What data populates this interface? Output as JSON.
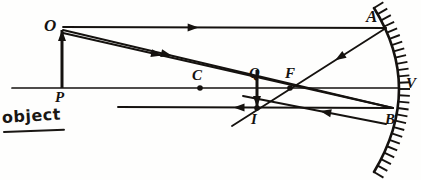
{
  "figure": {
    "kind": "optics-ray-diagram",
    "width": 421,
    "height": 180,
    "ink_color": "#15120f",
    "background_color": "#fefefd"
  },
  "annotation": {
    "object_caption": "object"
  },
  "points": [
    {
      "key": "O",
      "label": "O",
      "x": 62,
      "y": 28,
      "label_x": 44,
      "label_y": 17,
      "size": "big",
      "role": "object-tip",
      "dot": false
    },
    {
      "key": "P",
      "label": "P",
      "x": 62,
      "y": 88,
      "label_x": 55,
      "label_y": 90,
      "size": "mid",
      "role": "object-base-on-axis",
      "dot": false
    },
    {
      "key": "C",
      "label": "C",
      "x": 200,
      "y": 88,
      "label_x": 192,
      "label_y": 68,
      "size": "mid",
      "role": "center-of-curvature",
      "dot": true
    },
    {
      "key": "Q",
      "label": "Q",
      "x": 257,
      "y": 88,
      "label_x": 249,
      "label_y": 66,
      "size": "mid",
      "role": "image-base-on-axis",
      "dot": false
    },
    {
      "key": "F",
      "label": "F",
      "x": 290,
      "y": 88,
      "label_x": 285,
      "label_y": 66,
      "size": "mid",
      "role": "focal-point",
      "dot": true
    },
    {
      "key": "I",
      "label": "I",
      "x": 257,
      "y": 108,
      "label_x": 251,
      "label_y": 112,
      "size": "mid",
      "role": "image-tip",
      "dot": true
    },
    {
      "key": "A",
      "label": "A",
      "x": 386,
      "y": 28,
      "label_x": 366,
      "label_y": 8,
      "size": "big",
      "role": "upper-mirror-strike",
      "dot": false
    },
    {
      "key": "B",
      "label": "B",
      "x": 393,
      "y": 108,
      "label_x": 385,
      "label_y": 112,
      "size": "mid",
      "role": "lower-mirror-strike",
      "dot": false
    },
    {
      "key": "V",
      "label": "V",
      "x": 398,
      "y": 88,
      "label_x": 406,
      "label_y": 76,
      "size": "mid",
      "role": "mirror-vertex",
      "dot": false
    }
  ],
  "mirror": {
    "name": "concave-mirror",
    "vertex_x": 398,
    "vertex_y": 88,
    "top_x": 374,
    "top_y": 8,
    "bottom_x": 374,
    "bottom_y": 172,
    "bulge": 26,
    "hatch_count": 26,
    "hatch_length": 11,
    "stroke_width": 2.6
  },
  "axis": {
    "name": "principal-axis",
    "x1": 12,
    "y1": 88,
    "x2": 398,
    "y2": 88,
    "stroke_width": 1.7
  },
  "object_arrow": {
    "name": "object-arrow",
    "from_x": 62,
    "from_y": 88,
    "to_x": 62,
    "to_y": 30,
    "direction": "up",
    "stroke_width": 3.0
  },
  "image_arrow": {
    "name": "image-arrow",
    "from_x": 257,
    "from_y": 70,
    "to_x": 257,
    "to_y": 107,
    "direction": "down",
    "stroke_width": 3.0
  },
  "rays": [
    {
      "key": "ray-parallel-incident",
      "label": "incident parallel ray O to A",
      "x1": 63,
      "y1": 27,
      "x2": 386,
      "y2": 28,
      "arrow_t": 0.42,
      "arrow_dir": "forward",
      "width": 1.8
    },
    {
      "key": "ray-reflected-A-to-I",
      "label": "reflected ray A through F to I and beyond",
      "x1": 386,
      "y1": 28,
      "x2": 232,
      "y2": 126,
      "arrow_t": 0.33,
      "arrow_dir": "forward",
      "width": 1.9
    },
    {
      "key": "ray-through-C",
      "label": "ray O through C to mirror at B",
      "x1": 63,
      "y1": 30,
      "x2": 393,
      "y2": 108,
      "arrow_t": 0.33,
      "arrow_dir": "forward",
      "width": 1.9
    },
    {
      "key": "ray-reflected-B-to-left",
      "label": "reflected ray from B back along CB through I",
      "x1": 393,
      "y1": 108,
      "x2": 118,
      "y2": 107,
      "arrow_t": 0.58,
      "arrow_dir": "forward",
      "width": 1.9
    },
    {
      "key": "ray-O-to-V",
      "label": "ray O to vertex region via F",
      "x1": 63,
      "y1": 33,
      "x2": 393,
      "y2": 108,
      "arrow_t": 0.3,
      "arrow_dir": "forward",
      "width": 1.9
    },
    {
      "key": "ray-V-reflect-to-B",
      "label": "reflected ray toward B lower region",
      "x1": 386,
      "y1": 124,
      "x2": 243,
      "y2": 96,
      "arrow_t": 0.46,
      "arrow_dir": "forward",
      "width": 1.9
    }
  ],
  "arrowheads": {
    "style": "solid-triangle",
    "length": 11,
    "half_width": 4.0
  }
}
